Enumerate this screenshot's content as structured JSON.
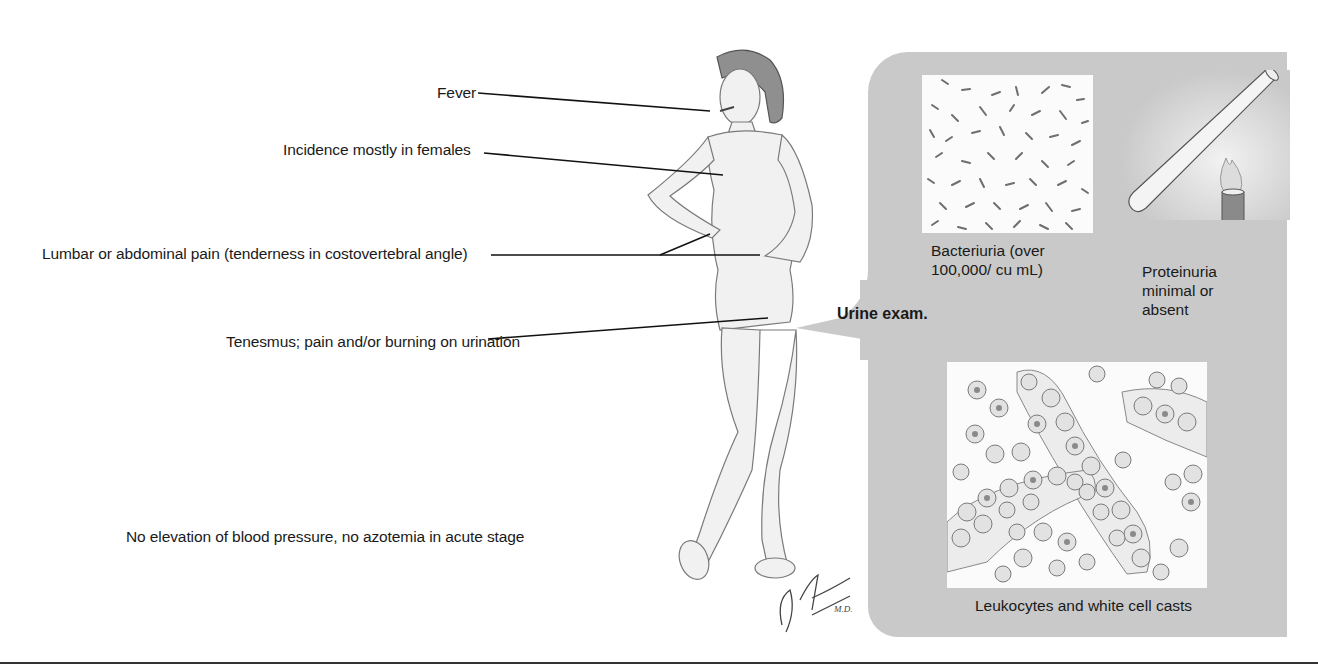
{
  "figure": {
    "labels": {
      "fever": "Fever",
      "incidence": "Incidence mostly in females",
      "lumbar_pain": "Lumbar or abdominal pain (tenderness in costovertebral angle)",
      "tenesmus": "Tenesmus; pain and/or burning on urination",
      "no_elevation": "No elevation of blood pressure, no azotemia in acute stage"
    },
    "signature": "F. Netter M.D."
  },
  "urine_exam": {
    "title": "Urine exam.",
    "bacteriuria": {
      "line1": "Bacteriuria (over",
      "line2": "100,000/ cu mL)"
    },
    "proteinuria": {
      "line1": "Proteinuria",
      "line2": "minimal or",
      "line3": "absent"
    },
    "leukocytes": "Leukocytes and white cell casts"
  },
  "colors": {
    "panel": "#c9c9c9",
    "text": "#1a1a1a",
    "rule": "#333333"
  }
}
